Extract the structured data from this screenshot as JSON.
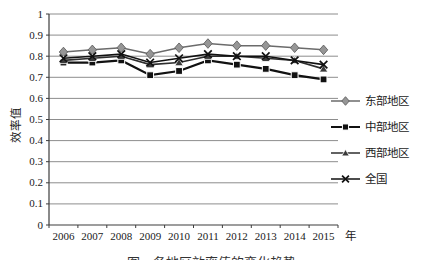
{
  "figure": {
    "ylabel": "效率值",
    "caption_partial": "图　各地区效率值的变化趋势"
  },
  "chart_data": {
    "type": "line",
    "title": "",
    "xlabel": "",
    "xlabel_suffix": "年",
    "ylabel": "效率值",
    "categories": [
      "2006",
      "2007",
      "2008",
      "2009",
      "2010",
      "2011",
      "2012",
      "2013",
      "2014",
      "2015"
    ],
    "ylim": [
      0,
      1
    ],
    "ytick_interval": 0.1,
    "grid": "horizontal",
    "legend_position": "right",
    "series": [
      {
        "name": "东部地区",
        "marker": "diamond",
        "marker_color": "#969696",
        "line_color": "#6b6b6b",
        "values": [
          0.82,
          0.83,
          0.84,
          0.81,
          0.84,
          0.86,
          0.85,
          0.85,
          0.84,
          0.83
        ]
      },
      {
        "name": "中部地区",
        "marker": "square",
        "marker_color": "#111111",
        "line_color": "#111111",
        "values": [
          0.77,
          0.77,
          0.78,
          0.71,
          0.73,
          0.78,
          0.76,
          0.74,
          0.71,
          0.69
        ]
      },
      {
        "name": "西部地区",
        "marker": "triangle",
        "marker_color": "#3a3a3a",
        "line_color": "#2e2e2e",
        "values": [
          0.78,
          0.79,
          0.8,
          0.76,
          0.77,
          0.8,
          0.8,
          0.79,
          0.78,
          0.74
        ]
      },
      {
        "name": "全国",
        "marker": "x",
        "marker_color": "#111111",
        "line_color": "#111111",
        "values": [
          0.79,
          0.8,
          0.81,
          0.77,
          0.79,
          0.81,
          0.8,
          0.8,
          0.78,
          0.76
        ]
      }
    ]
  },
  "colors": {
    "background": "#ffffff",
    "grid": "#808080",
    "axis": "#3c3c3c",
    "text": "#1a1a1a"
  }
}
